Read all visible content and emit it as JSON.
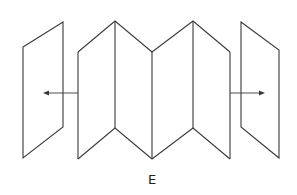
{
  "figure": {
    "label": "E",
    "stroke_color": "#3a3a3a",
    "background": "#ffffff"
  },
  "panels": {
    "left_panel": {
      "points": "23,47 63,22 63,127 23,158"
    },
    "right_panel": {
      "points": "241,22 279,50 279,158 241,127"
    }
  },
  "folded_sheet": {
    "top_path": "78,52 115,21 152,52 193,21 230,52",
    "bottom_path": "78,159 115,128 152,159 193,128 230,159",
    "verticals": [
      78,
      115,
      152,
      193,
      230
    ]
  },
  "arrows": {
    "left": {
      "x1": 78,
      "y1": 93,
      "x2": 44,
      "y2": 93,
      "direction": "left"
    },
    "right": {
      "x1": 230,
      "y1": 93,
      "x2": 263,
      "y2": 93,
      "direction": "right"
    }
  }
}
